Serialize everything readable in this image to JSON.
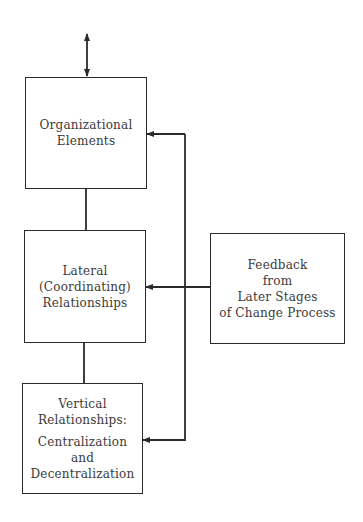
{
  "diagram": {
    "boxes": {
      "organizational": {
        "lines": [
          "Organizational",
          "Elements"
        ]
      },
      "lateral": {
        "lines": [
          "Lateral",
          "(Coordinating)",
          "Relationships"
        ]
      },
      "vertical": {
        "lines": [
          "Vertical",
          "Relationships:",
          "Centralization",
          "and",
          "Decentralization"
        ]
      },
      "feedback": {
        "lines": [
          "Feedback",
          "from",
          "Later Stages",
          "of Change Process"
        ]
      }
    },
    "edges": [
      {
        "from": "external",
        "to": "organizational",
        "type": "bidirectional-arrow"
      },
      {
        "from": "organizational",
        "to": "lateral",
        "type": "line"
      },
      {
        "from": "lateral",
        "to": "vertical",
        "type": "line"
      },
      {
        "from": "feedback",
        "to": "organizational",
        "type": "arrow"
      },
      {
        "from": "feedback",
        "to": "lateral",
        "type": "arrow"
      },
      {
        "from": "feedback",
        "to": "vertical",
        "type": "arrow"
      }
    ],
    "colors": {
      "line": "#2a2a2a",
      "text": "#3a3a3a",
      "background": "#ffffff"
    }
  }
}
